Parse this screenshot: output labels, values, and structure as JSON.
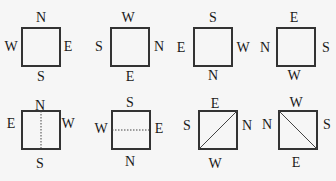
{
  "figures": [
    {
      "id": 1,
      "top": "N",
      "bottom": "S",
      "left": "W",
      "right": "E",
      "line": "none"
    },
    {
      "id": 2,
      "top": "W",
      "bottom": "E",
      "left": "S",
      "right": "N",
      "line": "none"
    },
    {
      "id": 3,
      "top": "S",
      "bottom": "N",
      "left": "E",
      "right": "W",
      "line": "none"
    },
    {
      "id": 4,
      "top": "E",
      "bottom": "W",
      "left": "N",
      "right": "S",
      "line": "none"
    },
    {
      "id": 5,
      "top": "N",
      "bottom": "S",
      "left": "E",
      "right": "W",
      "line": "vertical-dotted"
    },
    {
      "id": 6,
      "top": "S",
      "bottom": "N",
      "left": "W",
      "right": "E",
      "line": "horizontal-dotted"
    },
    {
      "id": 7,
      "top": "E",
      "bottom": "W",
      "left": "S",
      "right": "N",
      "line": "diagonal-bottomleft-topright"
    },
    {
      "id": 8,
      "top": "W",
      "bottom": "E",
      "left": "N",
      "right": "S",
      "line": "diagonal-topleft-bottomright"
    }
  ],
  "colors": {
    "stroke": "#333333",
    "background": "#f6f6f6",
    "text": "#1a1a1a"
  }
}
